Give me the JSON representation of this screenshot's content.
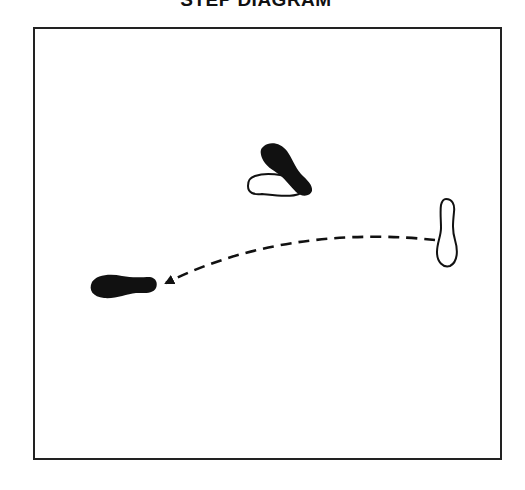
{
  "title": "STEP DIAGRAM",
  "colors": {
    "ink": "#111111",
    "frame": "#222222",
    "background": "#ffffff",
    "open_foot_fill": "#ffffff"
  },
  "diagram": {
    "footprints": [
      {
        "id": "foot-black-diagonal",
        "style": "filled",
        "description": "Black footprint, diagonal, toe toward upper-left",
        "position": {
          "x": 287,
          "y": 170
        }
      },
      {
        "id": "foot-white-under",
        "style": "outline",
        "description": "White outlined footprint beneath black diagonal foot, pointing left",
        "position": {
          "x": 274,
          "y": 186
        }
      },
      {
        "id": "foot-white-start",
        "style": "outline",
        "description": "White outlined footprint, vertical, on the right (starting position)",
        "position": {
          "x": 446,
          "y": 232
        }
      },
      {
        "id": "foot-black-end",
        "style": "filled",
        "description": "Black footprint, horizontal, toe pointing left (ending position)",
        "position": {
          "x": 123,
          "y": 286
        }
      }
    ],
    "path": {
      "style": "dashed",
      "from": {
        "x": 435,
        "y": 240
      },
      "to": {
        "x": 166,
        "y": 283
      },
      "arrowhead": "end"
    }
  }
}
